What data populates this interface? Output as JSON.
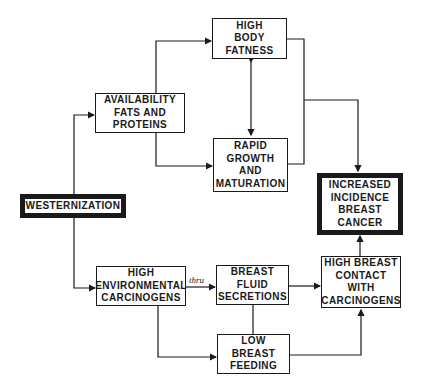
{
  "diagram": {
    "type": "flowchart",
    "nodes": {
      "westernization": "WESTERNIZATION",
      "availability": "AVAILABILITY\nFATS AND\nPROTEINS",
      "body_fatness": "HIGH\nBODY\nFATNESS",
      "rapid_growth": "RAPID\nGROWTH\nAND\nMATURATION",
      "incidence": "INCREASED\nINCIDENCE\nBREAST\nCANCER",
      "env_carcinogens": "HIGH\nENVIRONMENTAL\nCARCINOGENS",
      "breast_fluid": "BREAST\nFLUID\nSECRETIONS",
      "low_feeding": "LOW\nBREAST\nFEEDING",
      "breast_contact": "HIGH BREAST\nCONTACT\nWITH\nCARCINOGENS"
    },
    "edge_labels": {
      "thru": "thru"
    },
    "edges": [
      {
        "from": "westernization",
        "to": "availability"
      },
      {
        "from": "westernization",
        "to": "env_carcinogens"
      },
      {
        "from": "availability",
        "to": "body_fatness"
      },
      {
        "from": "availability",
        "to": "rapid_growth"
      },
      {
        "from": "body_fatness",
        "to": "rapid_growth",
        "bidirectional": true
      },
      {
        "from": "body_fatness",
        "to": "incidence"
      },
      {
        "from": "rapid_growth",
        "to": "incidence"
      },
      {
        "from": "env_carcinogens",
        "to": "breast_fluid",
        "label": "thru"
      },
      {
        "from": "env_carcinogens",
        "to": "low_feeding"
      },
      {
        "from": "breast_fluid",
        "to": "low_feeding",
        "undirected": true
      },
      {
        "from": "breast_fluid",
        "to": "breast_contact"
      },
      {
        "from": "low_feeding",
        "to": "breast_contact"
      },
      {
        "from": "breast_contact",
        "to": "incidence"
      }
    ]
  }
}
